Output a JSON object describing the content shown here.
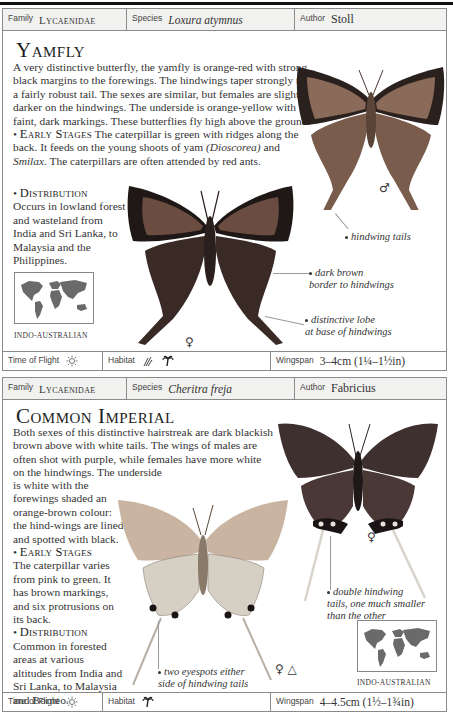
{
  "entries": [
    {
      "header": {
        "family_label": "Family",
        "family": "Lycaenidae",
        "species_label": "Species",
        "species": "Loxura atymnus",
        "author_label": "Author",
        "author": "Stoll"
      },
      "title": "Yamfly",
      "description": "A very distinctive butterfly, the yamfly is orange-red with strong black margins to the forewings. The hindwings taper strongly to a fairly robust tail. The sexes are similar, but females are slightly darker on the hindwings. The underside is orange-yellow with faint, dark markings. These butterflies fly high above the ground.",
      "early_stages_heading": "Early Stages",
      "early_stages_pre": "The caterpillar is green with ridges along the back. It feeds on the young shoots of yam ",
      "early_stages_it1": "(Dioscorea)",
      "early_stages_mid": " and ",
      "early_stages_it2": "Smilax",
      "early_stages_post": ". The caterpillars are often attended by red ants.",
      "distribution_heading": "Distribution",
      "distribution": "Occurs in lowland forest and wasteland from India and Sri Lanka, to Malaysia and the Philippines.",
      "map_label": "Indo-Australian",
      "annotations": {
        "hindwing_tails": "hindwing tails",
        "dark_brown_1": "dark brown",
        "dark_brown_2": "border to hindwings",
        "lobe_1": "distinctive lobe",
        "lobe_2": "at base of hindwings"
      },
      "symbols": {
        "male": "♂",
        "female": "♀"
      },
      "footer": {
        "time_label": "Time of Flight",
        "time_icon": "sun-icon",
        "habitat_label": "Habitat",
        "habitat_icons": [
          "grass-icon",
          "palm-tree-icon"
        ],
        "wingspan_label": "Wingspan",
        "wingspan": "3–4cm (1¼–1½in)"
      },
      "colors": {
        "wing": "#7a5a4a",
        "border": "#2a1f1c"
      }
    },
    {
      "header": {
        "family_label": "Family",
        "family": "Lycaenidae",
        "species_label": "Species",
        "species": "Cheritra freja",
        "author_label": "Author",
        "author": "Fabricius"
      },
      "title": "Common Imperial",
      "description_a": "Both sexes of this distinctive hairstreak are dark blackish brown above with white tails. The wings of males are often shot with purple, while females have more white on the hindwings. The underside",
      "description_b": "is white with the forewings shaded an orange-brown colour: the hind-wings are lined and spotted with black.",
      "early_stages_heading": "Early Stages",
      "early_stages": "The caterpillar varies from pink to green. It has brown markings, and six protrusions on its back.",
      "distribution_heading": "Distribution",
      "distribution": "Common in forested areas at various altitudes from India and Sri Lanka, to Malaysia and Borneo.",
      "map_label": "Indo-Australian",
      "annotations": {
        "double_1": "double hindwing",
        "double_2": "tails, one much smaller",
        "double_3": "than the other",
        "eyespots_1": "two eyespots either",
        "eyespots_2": "side of hindwing tails"
      },
      "symbols": {
        "female": "♀",
        "female_underside": "♀ △"
      },
      "footer": {
        "time_label": "Time of Flight",
        "time_icon": "sun-icon",
        "habitat_label": "Habitat",
        "habitat_icons": [
          "palm-tree-icon"
        ],
        "wingspan_label": "Wingspan",
        "wingspan": "4–4.5cm (1½–1¾in)"
      },
      "colors": {
        "wing": "#4a3a3a",
        "underside": "#c8b8a0"
      }
    }
  ]
}
